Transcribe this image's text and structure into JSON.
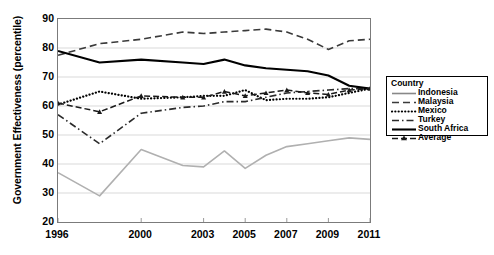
{
  "chart_data": {
    "type": "line",
    "title": "",
    "xlabel": "",
    "ylabel": "Government Effectiveness (percentile)",
    "ylim": [
      20,
      90
    ],
    "yticks": [
      20,
      30,
      40,
      50,
      60,
      70,
      80,
      90
    ],
    "xlim": [
      1996,
      2011
    ],
    "x": [
      1996,
      1998,
      2000,
      2002,
      2003,
      2004,
      2005,
      2006,
      2007,
      2008,
      2009,
      2010,
      2011
    ],
    "xticks": [
      1996,
      2000,
      2003,
      2005,
      2007,
      2009,
      2011
    ],
    "xticklabels": [
      "1996",
      "2000",
      "2003",
      "2005",
      "2007",
      "2009",
      "2011"
    ],
    "grid": true,
    "legend_position": "right",
    "legend_title": "Country",
    "series": [
      {
        "name": "Indonesia",
        "style": "solid",
        "color": "#b0b0b0",
        "width": 1.6,
        "values": [
          37,
          29,
          45,
          39.5,
          39,
          44.5,
          38.5,
          43,
          46,
          47,
          48,
          49,
          48.5
        ]
      },
      {
        "name": "Malaysia",
        "style": "dashed",
        "color": "#3a3a3a",
        "width": 1.6,
        "values": [
          77.5,
          81.5,
          83,
          85.5,
          85,
          85.5,
          86,
          86.5,
          85.5,
          83,
          79.5,
          82.5,
          83
        ]
      },
      {
        "name": "Mexico",
        "style": "dotted",
        "color": "#000000",
        "width": 2.2,
        "values": [
          60.5,
          65,
          62.5,
          63,
          63.5,
          63.5,
          65.5,
          62,
          62.5,
          62.5,
          63,
          64.5,
          66
        ]
      },
      {
        "name": "Turkey",
        "style": "dashdot",
        "color": "#2b2b2b",
        "width": 1.6,
        "values": [
          57,
          47,
          57.5,
          59.5,
          60,
          61.5,
          61.5,
          63,
          64.5,
          65,
          65.5,
          66,
          66
        ]
      },
      {
        "name": "South Africa",
        "style": "solid",
        "color": "#000000",
        "width": 2.1,
        "values": [
          79,
          75,
          76,
          75,
          74.5,
          76,
          74,
          73,
          72.5,
          72,
          70.5,
          67,
          66
        ]
      },
      {
        "name": "Average",
        "style": "dash-marker",
        "color": "#1a1a1a",
        "width": 1.5,
        "marker": "triangle",
        "values": [
          61,
          58,
          63.5,
          63,
          63,
          65,
          63.5,
          64.5,
          65.5,
          64.5,
          64,
          65.5,
          66
        ]
      }
    ]
  },
  "legend": {
    "title": "Country",
    "items": [
      {
        "label": "Indonesia"
      },
      {
        "label": "Malaysia"
      },
      {
        "label": "Mexico"
      },
      {
        "label": "Turkey"
      },
      {
        "label": "South Africa"
      },
      {
        "label": "Average"
      }
    ]
  },
  "axes": {
    "y_title": "Government Effectiveness (percentile)",
    "y_labels": [
      "90",
      "80",
      "70",
      "60",
      "50",
      "40",
      "30",
      "20"
    ],
    "x_labels": [
      "1996",
      "2000",
      "2003",
      "2005",
      "2007",
      "2009",
      "2011"
    ]
  }
}
